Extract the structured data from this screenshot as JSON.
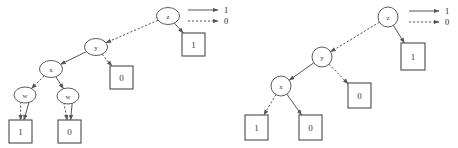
{
  "figure": {
    "type": "binary-decision-diagram-pair",
    "background_color": "#ffffff",
    "edge_color": "#555555",
    "node_stroke_color": "#4a4a4a",
    "text_color": "#3a3a3a"
  },
  "legend": {
    "entries": [
      {
        "style": "solid",
        "label": "1"
      },
      {
        "style": "dashed",
        "label": "0"
      }
    ]
  },
  "diagrams": [
    {
      "id": "left-bdd",
      "name": "unreduced-bdd",
      "decision_nodes": [
        {
          "id": "L_z",
          "label": "z",
          "cx": 168,
          "cy": 16,
          "rx": 11.5,
          "ry": 8.5
        },
        {
          "id": "L_y",
          "label": "y",
          "cx": 96,
          "cy": 47,
          "rx": 11.5,
          "ry": 8.5
        },
        {
          "id": "L_x",
          "label": "x",
          "cx": 51,
          "cy": 69,
          "rx": 11.5,
          "ry": 8.5
        },
        {
          "id": "L_w1",
          "label": "w",
          "cx": 25,
          "cy": 95,
          "rx": 11.0,
          "ry": 8.0
        },
        {
          "id": "L_w2",
          "label": "w",
          "cx": 68,
          "cy": 96,
          "rx": 11.0,
          "ry": 8.0
        }
      ],
      "terminals": [
        {
          "id": "L_t1",
          "label": "1",
          "x": 182,
          "y": 33,
          "w": 23,
          "h": 23
        },
        {
          "id": "L_t2",
          "label": "0",
          "x": 110,
          "y": 66,
          "w": 23,
          "h": 23
        },
        {
          "id": "L_t3",
          "label": "1",
          "x": 9,
          "y": 120,
          "w": 23,
          "h": 23
        },
        {
          "id": "L_t4",
          "label": "0",
          "x": 58,
          "y": 120,
          "w": 23,
          "h": 23
        }
      ],
      "edges": [
        {
          "from": "L_z",
          "to": "L_t1",
          "value": "1",
          "style": "solid"
        },
        {
          "from": "L_z",
          "to": "L_y",
          "value": "0",
          "style": "dashed"
        },
        {
          "from": "L_y",
          "to": "L_x",
          "value": "1",
          "style": "solid"
        },
        {
          "from": "L_y",
          "to": "L_t2",
          "value": "0",
          "style": "dashed"
        },
        {
          "from": "L_x",
          "to": "L_w2",
          "value": "1",
          "style": "solid"
        },
        {
          "from": "L_x",
          "to": "L_w1",
          "value": "0",
          "style": "dashed"
        },
        {
          "from": "L_w1",
          "to": "L_t3",
          "value": "1",
          "style": "solid"
        },
        {
          "from": "L_w1",
          "to": "L_t3",
          "value": "0",
          "style": "dashed"
        },
        {
          "from": "L_w2",
          "to": "L_t4",
          "value": "1",
          "style": "solid"
        },
        {
          "from": "L_w2",
          "to": "L_t4",
          "value": "0",
          "style": "dashed"
        }
      ]
    },
    {
      "id": "right-bdd",
      "name": "reduced-bdd",
      "decision_nodes": [
        {
          "id": "R_z",
          "label": "z",
          "cx": 388,
          "cy": 17,
          "rx": 10.0,
          "ry": 10.0
        },
        {
          "id": "R_y",
          "label": "y",
          "cx": 322,
          "cy": 57,
          "rx": 10.0,
          "ry": 10.0
        },
        {
          "id": "R_x",
          "label": "x",
          "cx": 281,
          "cy": 86,
          "rx": 10.0,
          "ry": 10.0
        }
      ],
      "terminals": [
        {
          "id": "R_t1",
          "label": "1",
          "x": 401,
          "y": 43,
          "w": 24,
          "h": 27
        },
        {
          "id": "R_t2",
          "label": "0",
          "x": 348,
          "y": 83,
          "w": 23,
          "h": 25
        },
        {
          "id": "R_t3",
          "label": "1",
          "x": 245,
          "y": 115,
          "w": 23,
          "h": 25
        },
        {
          "id": "R_t4",
          "label": "0",
          "x": 299,
          "y": 115,
          "w": 23,
          "h": 25
        }
      ],
      "edges": [
        {
          "from": "R_z",
          "to": "R_t1",
          "value": "1",
          "style": "solid"
        },
        {
          "from": "R_z",
          "to": "R_y",
          "value": "0",
          "style": "dashed"
        },
        {
          "from": "R_y",
          "to": "R_x",
          "value": "1",
          "style": "solid"
        },
        {
          "from": "R_y",
          "to": "R_t2",
          "value": "0",
          "style": "dashed"
        },
        {
          "from": "R_x",
          "to": "R_t4",
          "value": "1",
          "style": "solid"
        },
        {
          "from": "R_x",
          "to": "R_t3",
          "value": "0",
          "style": "dashed"
        }
      ]
    }
  ],
  "legends": [
    {
      "id": "legend-left",
      "x": 188,
      "y": 10,
      "line_len": 30
    },
    {
      "id": "legend-right",
      "x": 409,
      "y": 11,
      "line_len": 30
    }
  ]
}
